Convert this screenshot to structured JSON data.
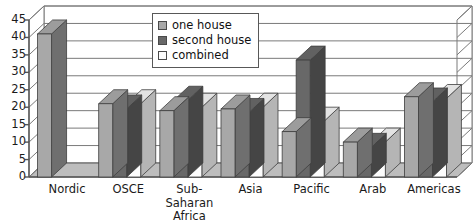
{
  "chart_data": {
    "type": "bar",
    "title": "",
    "subtitle": "",
    "xlabel": "",
    "ylabel": "",
    "ylim": [
      0,
      45
    ],
    "ytick_step": 5,
    "yticks": [
      45,
      40,
      35,
      30,
      25,
      20,
      15,
      10,
      5,
      0
    ],
    "grid": true,
    "grid_axis": "y",
    "legend_position": "top-center",
    "style": "3d-grouped-columns",
    "categories": [
      "Nordic",
      "OSCE",
      "Sub-\nSaharan\nAfrica",
      "Asia",
      "Pacific",
      "Arab",
      "Americas"
    ],
    "series": [
      {
        "name": "one house",
        "color": "#a8a8a8",
        "values": [
          41,
          21,
          19,
          19.5,
          13,
          10,
          23
        ]
      },
      {
        "name": "second house",
        "color": "#686868",
        "values": [
          null,
          19.5,
          22,
          18.5,
          33.5,
          8.5,
          21.5
        ]
      },
      {
        "name": "combined",
        "color": "#fcfcfc",
        "values": [
          null,
          21,
          20,
          20,
          16,
          10,
          22.5
        ]
      }
    ]
  },
  "legend": {
    "items": [
      {
        "label": "one house",
        "color": "#a8a8a8"
      },
      {
        "label": "second house",
        "color": "#686868"
      },
      {
        "label": "combined",
        "color": "#fcfcfc"
      }
    ]
  },
  "colors": {
    "one_house": "#a8a8a8",
    "second_house": "#686868",
    "combined": "#fcfcfc",
    "axis": "#555555",
    "grid": "#7a7a7a",
    "floor": "#bdbdbd",
    "text": "#1a1a1a"
  }
}
